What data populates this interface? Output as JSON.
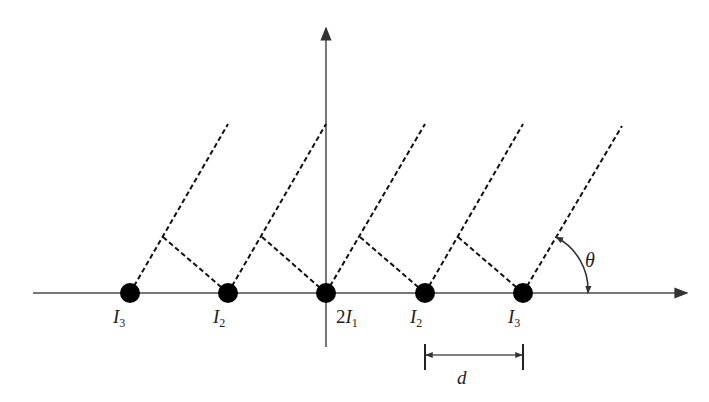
{
  "diagram": {
    "type": "linear-antenna-array",
    "colors": {
      "axis": "#777777",
      "dashed": "#111111",
      "element": "#000000",
      "text": "#222222"
    },
    "axes": {
      "x_axis": {
        "from": [
          33,
          293
        ],
        "to": [
          687,
          293
        ]
      },
      "y_axis": {
        "from": [
          326,
          347
        ],
        "to": [
          326,
          28
        ]
      }
    },
    "elements": [
      {
        "x": 130,
        "y": 293,
        "label_main": "I",
        "label_prefix": "",
        "label_sub": "3",
        "label_pos": [
          113,
          307
        ]
      },
      {
        "x": 228,
        "y": 293,
        "label_main": "I",
        "label_prefix": "",
        "label_sub": "2",
        "label_pos": [
          213,
          307
        ]
      },
      {
        "x": 326,
        "y": 293,
        "label_main": "I",
        "label_prefix": "2",
        "label_sub": "1",
        "label_pos": [
          336,
          307
        ]
      },
      {
        "x": 425,
        "y": 293,
        "label_main": "I",
        "label_prefix": "",
        "label_sub": "2",
        "label_pos": [
          410,
          307
        ]
      },
      {
        "x": 523,
        "y": 293,
        "label_main": "I",
        "label_prefix": "",
        "label_sub": "3",
        "label_pos": [
          508,
          307
        ]
      }
    ],
    "rays": [
      {
        "from": [
          130,
          293
        ],
        "to": [
          228,
          124
        ]
      },
      {
        "from": [
          228,
          293
        ],
        "to": [
          326,
          124
        ]
      },
      {
        "from": [
          326,
          293
        ],
        "to": [
          425,
          124
        ]
      },
      {
        "from": [
          425,
          293
        ],
        "to": [
          523,
          124
        ]
      },
      {
        "from": [
          523,
          293
        ],
        "to": [
          622,
          126
        ]
      }
    ],
    "path_difference_lines": [
      {
        "from": [
          163,
          237
        ],
        "to": [
          228,
          293
        ]
      },
      {
        "from": [
          262,
          237
        ],
        "to": [
          326,
          293
        ]
      },
      {
        "from": [
          360,
          237
        ],
        "to": [
          425,
          293
        ]
      },
      {
        "from": [
          458,
          237
        ],
        "to": [
          523,
          293
        ]
      }
    ],
    "angle": {
      "label": "θ",
      "arc_start": [
        556,
        237
      ],
      "arc_end": [
        588,
        293
      ],
      "label_pos": [
        585,
        264
      ]
    },
    "spacing": {
      "label": "d",
      "left_x": 425,
      "right_x": 523,
      "tick_top": 344,
      "tick_bottom": 370,
      "arrow_y": 355,
      "label_pos": [
        457,
        368
      ]
    }
  }
}
